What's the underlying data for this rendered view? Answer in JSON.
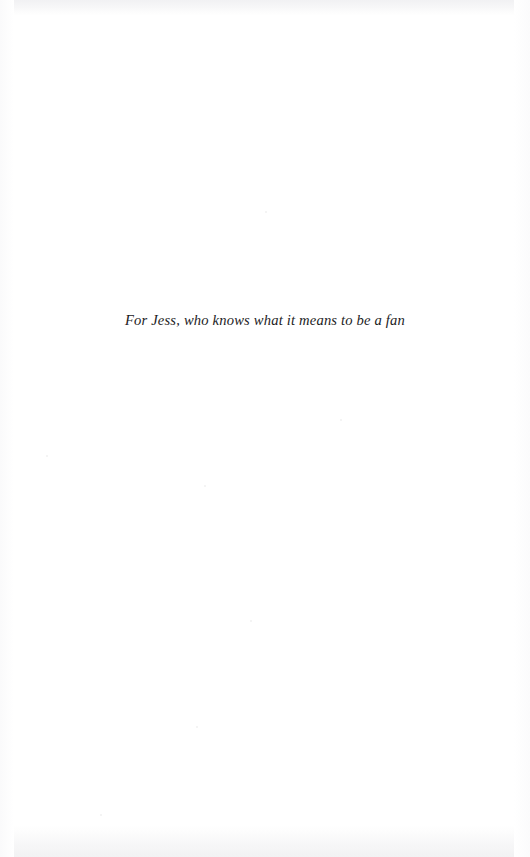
{
  "page": {
    "kind": "book-dedication-page",
    "width": 530,
    "height": 857,
    "background_color": "#ffffff",
    "text_color": "#1c1c1e",
    "scan_shade_color": "#f1f1f3"
  },
  "dedication": {
    "text": "For Jess, who knows what it means to be a fan",
    "style": "italic",
    "alignment": "center"
  },
  "folio": {
    "page_number": ""
  }
}
